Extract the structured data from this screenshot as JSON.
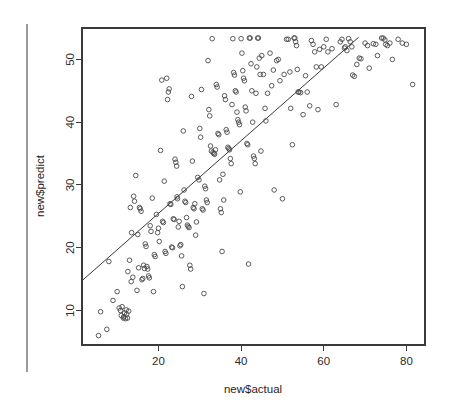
{
  "chart_data": {
    "type": "scatter",
    "title": "",
    "xlabel": "new$actual",
    "ylabel": "new$predict",
    "xlim": [
      1.5,
      84.5
    ],
    "ylim": [
      4.5,
      55.0
    ],
    "xticks": [
      20,
      40,
      60,
      80
    ],
    "yticks": [
      10,
      20,
      30,
      40,
      50
    ],
    "grid": false,
    "legend": null,
    "annotations": [],
    "reference_line": {
      "name": "regression-fit-line",
      "x": [
        1.6,
        68.4
      ],
      "y": [
        14.8,
        53.5
      ]
    },
    "points": [
      [
        5.5,
        6.0
      ],
      [
        6.0,
        9.8
      ],
      [
        7.5,
        7.0
      ],
      [
        8.0,
        17.8
      ],
      [
        9.0,
        11.6
      ],
      [
        10.0,
        13.0
      ],
      [
        10.5,
        10.4
      ],
      [
        10.8,
        10.0
      ],
      [
        11.0,
        9.2
      ],
      [
        11.2,
        10.6
      ],
      [
        11.5,
        8.8
      ],
      [
        11.6,
        9.0
      ],
      [
        11.8,
        9.6
      ],
      [
        12.0,
        8.7
      ],
      [
        12.2,
        10.1
      ],
      [
        12.3,
        9.4
      ],
      [
        12.5,
        8.8
      ],
      [
        12.6,
        16.2
      ],
      [
        12.8,
        9.9
      ],
      [
        13.0,
        18.0
      ],
      [
        13.2,
        26.4
      ],
      [
        13.4,
        14.6
      ],
      [
        13.5,
        22.4
      ],
      [
        13.8,
        15.3
      ],
      [
        14.0,
        28.2
      ],
      [
        14.2,
        27.4
      ],
      [
        14.5,
        31.5
      ],
      [
        14.8,
        13.2
      ],
      [
        15.0,
        22.1
      ],
      [
        15.2,
        16.8
      ],
      [
        15.4,
        26.4
      ],
      [
        15.6,
        26.2
      ],
      [
        15.8,
        25.8
      ],
      [
        16.0,
        14.9
      ],
      [
        16.2,
        15.1
      ],
      [
        16.4,
        17.2
      ],
      [
        16.6,
        16.7
      ],
      [
        16.8,
        20.6
      ],
      [
        17.0,
        20.2
      ],
      [
        17.2,
        17.0
      ],
      [
        17.4,
        16.6
      ],
      [
        17.6,
        15.5
      ],
      [
        17.8,
        15.2
      ],
      [
        18.0,
        23.5
      ],
      [
        18.2,
        22.6
      ],
      [
        18.5,
        27.9
      ],
      [
        18.8,
        13.0
      ],
      [
        19.0,
        18.9
      ],
      [
        19.2,
        18.6
      ],
      [
        19.5,
        25.3
      ],
      [
        19.8,
        22.4
      ],
      [
        20.0,
        23.1
      ],
      [
        20.2,
        21.0
      ],
      [
        20.5,
        35.5
      ],
      [
        20.8,
        46.7
      ],
      [
        21.0,
        24.2
      ],
      [
        21.2,
        24.0
      ],
      [
        21.4,
        30.6
      ],
      [
        21.6,
        19.4
      ],
      [
        21.8,
        19.1
      ],
      [
        22.0,
        47.0
      ],
      [
        22.2,
        43.6
      ],
      [
        22.4,
        44.8
      ],
      [
        22.6,
        45.3
      ],
      [
        22.8,
        27.0
      ],
      [
        23.0,
        26.9
      ],
      [
        23.2,
        20.1
      ],
      [
        23.4,
        20.0
      ],
      [
        23.6,
        24.6
      ],
      [
        23.8,
        24.5
      ],
      [
        24.0,
        34.1
      ],
      [
        24.2,
        33.6
      ],
      [
        24.4,
        33.0
      ],
      [
        24.5,
        28.1
      ],
      [
        24.6,
        27.8
      ],
      [
        24.8,
        23.3
      ],
      [
        25.0,
        24.2
      ],
      [
        25.2,
        20.3
      ],
      [
        25.4,
        20.5
      ],
      [
        25.6,
        18.7
      ],
      [
        25.8,
        13.8
      ],
      [
        26.0,
        38.6
      ],
      [
        26.2,
        29.2
      ],
      [
        26.4,
        27.4
      ],
      [
        26.6,
        27.2
      ],
      [
        26.8,
        24.8
      ],
      [
        27.0,
        23.6
      ],
      [
        27.2,
        23.4
      ],
      [
        27.4,
        23.2
      ],
      [
        27.6,
        17.2
      ],
      [
        27.8,
        16.6
      ],
      [
        28.0,
        44.1
      ],
      [
        28.2,
        33.8
      ],
      [
        28.4,
        26.4
      ],
      [
        28.6,
        26.2
      ],
      [
        28.8,
        27.0
      ],
      [
        29.0,
        22.0
      ],
      [
        29.2,
        24.1
      ],
      [
        29.5,
        31.2
      ],
      [
        29.8,
        30.8
      ],
      [
        30.0,
        39.0
      ],
      [
        30.2,
        37.6
      ],
      [
        30.4,
        45.2
      ],
      [
        30.6,
        26.2
      ],
      [
        30.8,
        26.0
      ],
      [
        31.0,
        12.7
      ],
      [
        31.2,
        29.8
      ],
      [
        31.4,
        29.4
      ],
      [
        31.6,
        27.6
      ],
      [
        31.8,
        27.2
      ],
      [
        32.0,
        49.8
      ],
      [
        32.2,
        42.0
      ],
      [
        32.4,
        41.0
      ],
      [
        32.6,
        36.2
      ],
      [
        32.8,
        35.4
      ],
      [
        33.0,
        53.3
      ],
      [
        33.2,
        35.2
      ],
      [
        33.4,
        35.0
      ],
      [
        33.6,
        34.9
      ],
      [
        33.8,
        35.6
      ],
      [
        34.0,
        46.0
      ],
      [
        34.2,
        45.6
      ],
      [
        34.4,
        38.2
      ],
      [
        34.6,
        38.0
      ],
      [
        34.8,
        30.8
      ],
      [
        35.0,
        26.2
      ],
      [
        35.2,
        25.6
      ],
      [
        35.4,
        19.4
      ],
      [
        35.6,
        31.7
      ],
      [
        35.8,
        27.6
      ],
      [
        36.0,
        44.2
      ],
      [
        36.2,
        43.6
      ],
      [
        36.4,
        38.8
      ],
      [
        36.6,
        38.4
      ],
      [
        36.8,
        36.0
      ],
      [
        37.0,
        35.8
      ],
      [
        37.2,
        35.6
      ],
      [
        37.4,
        34.2
      ],
      [
        37.6,
        33.4
      ],
      [
        37.8,
        42.8
      ],
      [
        38.0,
        53.3
      ],
      [
        38.2,
        47.9
      ],
      [
        38.4,
        47.5
      ],
      [
        38.6,
        45.0
      ],
      [
        38.8,
        44.8
      ],
      [
        39.0,
        41.6
      ],
      [
        39.2,
        40.4
      ],
      [
        39.4,
        40.0
      ],
      [
        39.6,
        39.6
      ],
      [
        39.8,
        28.9
      ],
      [
        40.0,
        53.3
      ],
      [
        40.2,
        51.0
      ],
      [
        40.4,
        48.2
      ],
      [
        40.6,
        47.0
      ],
      [
        40.8,
        46.6
      ],
      [
        41.0,
        42.4
      ],
      [
        41.2,
        41.8
      ],
      [
        41.4,
        36.6
      ],
      [
        41.6,
        36.4
      ],
      [
        41.8,
        17.4
      ],
      [
        42.0,
        53.4
      ],
      [
        42.2,
        53.4
      ],
      [
        42.4,
        49.3
      ],
      [
        42.6,
        45.0
      ],
      [
        42.8,
        40.0
      ],
      [
        43.0,
        34.6
      ],
      [
        43.2,
        34.2
      ],
      [
        43.4,
        33.4
      ],
      [
        43.6,
        44.6
      ],
      [
        43.8,
        48.8
      ],
      [
        44.0,
        53.4
      ],
      [
        44.2,
        53.4
      ],
      [
        44.4,
        50.2
      ],
      [
        44.6,
        47.6
      ],
      [
        44.8,
        35.4
      ],
      [
        45.0,
        50.6
      ],
      [
        45.4,
        47.6
      ],
      [
        45.8,
        42.2
      ],
      [
        46.0,
        40.2
      ],
      [
        46.4,
        44.6
      ],
      [
        47.0,
        51.0
      ],
      [
        47.4,
        45.8
      ],
      [
        47.8,
        48.3
      ],
      [
        48.0,
        29.2
      ],
      [
        48.6,
        49.8
      ],
      [
        49.0,
        50.0
      ],
      [
        49.4,
        46.6
      ],
      [
        50.0,
        27.8
      ],
      [
        50.4,
        47.6
      ],
      [
        51.0,
        53.2
      ],
      [
        51.4,
        53.2
      ],
      [
        51.8,
        48.0
      ],
      [
        52.0,
        42.2
      ],
      [
        52.4,
        36.4
      ],
      [
        52.8,
        53.4
      ],
      [
        53.0,
        53.4
      ],
      [
        53.2,
        52.8
      ],
      [
        53.4,
        52.2
      ],
      [
        53.6,
        48.4
      ],
      [
        53.8,
        44.8
      ],
      [
        54.0,
        44.8
      ],
      [
        54.4,
        44.7
      ],
      [
        55.0,
        41.2
      ],
      [
        55.6,
        47.4
      ],
      [
        56.0,
        44.8
      ],
      [
        56.6,
        42.6
      ],
      [
        57.0,
        53.0
      ],
      [
        57.4,
        52.4
      ],
      [
        57.8,
        51.2
      ],
      [
        58.2,
        48.8
      ],
      [
        58.6,
        42.0
      ],
      [
        59.0,
        51.6
      ],
      [
        59.4,
        48.8
      ],
      [
        60.0,
        52.0
      ],
      [
        60.6,
        53.2
      ],
      [
        61.0,
        51.2
      ],
      [
        62.0,
        51.7
      ],
      [
        63.0,
        42.8
      ],
      [
        64.0,
        52.8
      ],
      [
        64.4,
        53.2
      ],
      [
        65.0,
        51.8
      ],
      [
        65.2,
        52.0
      ],
      [
        65.6,
        51.4
      ],
      [
        66.0,
        53.3
      ],
      [
        66.4,
        52.8
      ],
      [
        66.8,
        52.0
      ],
      [
        67.0,
        47.5
      ],
      [
        67.4,
        47.3
      ],
      [
        68.0,
        49.2
      ],
      [
        68.6,
        50.2
      ],
      [
        69.0,
        50.1
      ],
      [
        70.0,
        52.6
      ],
      [
        70.6,
        52.2
      ],
      [
        71.0,
        48.6
      ],
      [
        72.0,
        52.5
      ],
      [
        72.6,
        52.4
      ],
      [
        73.0,
        50.6
      ],
      [
        74.0,
        53.4
      ],
      [
        74.4,
        53.4
      ],
      [
        74.8,
        53.1
      ],
      [
        75.0,
        52.4
      ],
      [
        75.4,
        52.2
      ],
      [
        76.0,
        52.6
      ],
      [
        76.6,
        50.0
      ],
      [
        78.0,
        53.2
      ],
      [
        79.0,
        52.6
      ],
      [
        80.0,
        52.4
      ],
      [
        81.5,
        46.0
      ]
    ]
  },
  "style": {
    "point_color": "#4a4a4a",
    "line_color": "#3a3a3a",
    "axis_color": "#3a3a3a",
    "text_color": "#1f1f1f",
    "background": "#ffffff"
  }
}
